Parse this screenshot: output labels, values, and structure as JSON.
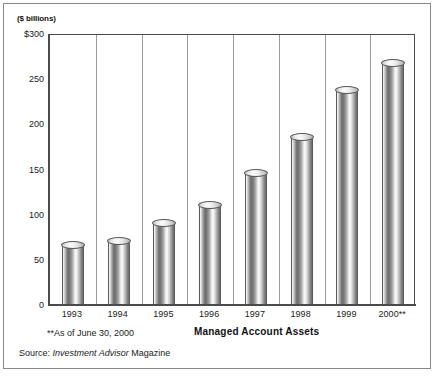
{
  "figure": {
    "units_label": "($ billions)",
    "x_axis_title": "Managed Account Assets",
    "footnote": "**As of June 30, 2000",
    "source_prefix": "Source: ",
    "source_italic": "Investment Advisor",
    "source_suffix": " Magazine"
  },
  "chart_data": {
    "type": "bar",
    "title": "",
    "xlabel": "Managed Account Assets",
    "ylabel": "($ billions)",
    "ylim": [
      0,
      300
    ],
    "yticks": [
      0,
      50,
      100,
      150,
      200,
      250,
      300
    ],
    "ytick_labels": [
      "0",
      "50",
      "100",
      "150",
      "200",
      "250",
      "$300"
    ],
    "grid": "vertical",
    "legend": "none",
    "categories": [
      "1993",
      "1994",
      "1995",
      "1996",
      "1997",
      "1998",
      "1999",
      "2000**"
    ],
    "values": [
      65,
      70,
      90,
      110,
      145,
      185,
      237,
      267
    ],
    "bar_style": "cylinder-3d",
    "colors": {
      "bar_light": "#fbfbfb",
      "bar_dark": "#6e6e6e",
      "axis": "#4a4a4a",
      "gridline": "#9a9a9a",
      "frame": "#8a8a8a",
      "text": "#1a1a1a",
      "background": "#ffffff"
    },
    "annotations": [
      "**As of June 30, 2000",
      "Source: Investment Advisor Magazine"
    ]
  }
}
